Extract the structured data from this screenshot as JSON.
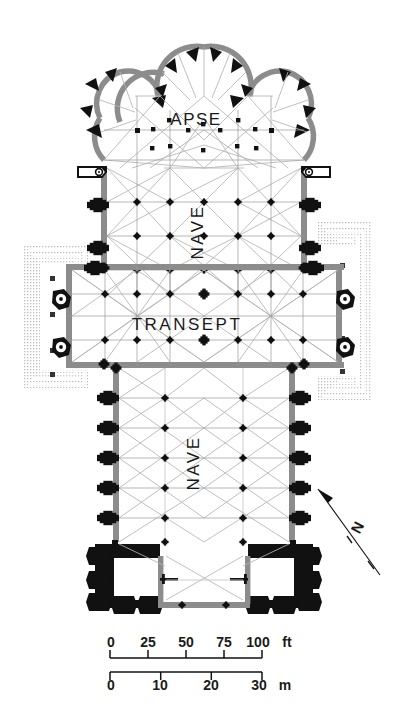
{
  "diagram": {
    "type": "architectural-floor-plan",
    "orientation": "apse at top (liturgical east), west front at bottom",
    "background_color": "#ffffff",
    "colors": {
      "wall_solid": "#111111",
      "wall_grey": "#8c8c8c",
      "vault_rib": "#b0b0b0",
      "thin_line": "#9a9a9a",
      "hatch": "#c9c9c9",
      "text": "#1a1a1a"
    },
    "labels": [
      {
        "id": "apse",
        "text": "APSE",
        "rotation": 0,
        "x": 196,
        "y": 125,
        "size": 17,
        "tracking": 1.5
      },
      {
        "id": "nave-upper",
        "text": "NAVE",
        "rotation": -90,
        "x": 203,
        "y": 232,
        "size": 17,
        "tracking": 2.5
      },
      {
        "id": "transept",
        "text": "TRANSEPT",
        "rotation": 0,
        "x": 187,
        "y": 330,
        "size": 17,
        "tracking": 2.5
      },
      {
        "id": "nave-lower",
        "text": "NAVE",
        "rotation": -90,
        "x": 199,
        "y": 463,
        "size": 17,
        "tracking": 2.5
      }
    ],
    "compass": {
      "name": "north-arrow",
      "letter": "N",
      "letter_x": 362,
      "letter_y": 530,
      "letter_rotation": -62,
      "arrow_from": {
        "x": 380,
        "y": 575
      },
      "arrow_to": {
        "x": 318,
        "y": 489
      }
    },
    "scale_bar": {
      "name": "scale-bar",
      "x": 110,
      "y_line_feet": 658,
      "y_line_meters": 672,
      "length_px": 152,
      "imperial": {
        "unit": "ft",
        "ticks": [
          "0",
          "25",
          "50",
          "75",
          "100"
        ],
        "tick_positions_px": [
          0,
          38,
          76,
          114,
          152
        ],
        "unit_label": "ft"
      },
      "metric": {
        "unit": "m",
        "ticks": [
          "0",
          "10",
          "20",
          "30"
        ],
        "tick_positions_px": [
          0,
          50.7,
          101.3,
          152
        ],
        "unit_label": "m"
      }
    },
    "regions": [
      {
        "id": "chevet-chapels",
        "label": "radiating chapels",
        "count": 5
      },
      {
        "id": "apse-ambulatory",
        "label": "ambulatory"
      },
      {
        "id": "choir",
        "label": "choir / upper nave"
      },
      {
        "id": "crossing",
        "label": "crossing"
      },
      {
        "id": "transept-arms",
        "label": "transept arms",
        "count": 2
      },
      {
        "id": "nave-lower-bays",
        "label": "nave bays",
        "count": 6
      },
      {
        "id": "west-towers",
        "label": "west front towers",
        "count": 2
      },
      {
        "id": "cloister-hatch-left",
        "label": "adjoining hatched structure (left)"
      },
      {
        "id": "cloister-hatch-right",
        "label": "adjoining hatched structure (right)"
      },
      {
        "id": "stair-turrets",
        "label": "spiral stair turrets",
        "count": 4
      }
    ]
  }
}
